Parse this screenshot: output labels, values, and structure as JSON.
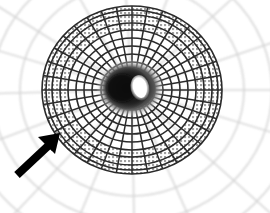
{
  "figure": {
    "title": "Radial mesh funnel with annotation arrow",
    "background_color": "#ffffff",
    "width": 270,
    "height": 213
  },
  "mesh": {
    "name": "polar-funnel-mesh",
    "center_x": 132,
    "center_y": 90,
    "radial_spokes": 36,
    "ring_count": 11,
    "outer_radius_x": 90,
    "outer_radius_y": 84,
    "inner_throat_radius_x": 26,
    "inner_throat_radius_y": 22,
    "line_color": "#262626",
    "faint_line_color": "#c9c9c9",
    "shade_band_color": "#9a9a9a",
    "shade_band_inner_fraction": 0.72,
    "shade_band_outer_fraction": 1.0,
    "ring_radii_fraction": [
      0.17,
      0.26,
      0.35,
      0.44,
      0.53,
      0.62,
      0.71,
      0.8,
      0.88,
      0.95,
      1.0
    ]
  },
  "throat": {
    "name": "central-throat",
    "center_x": 130,
    "center_y": 88,
    "radius_x": 30,
    "radius_y": 26,
    "dark_color": "#1a1a1a",
    "mid_color": "#4d4d4d"
  },
  "highlight": {
    "name": "throat-highlight",
    "center_x": 140,
    "center_y": 88,
    "radius_x": 8,
    "radius_y": 12,
    "color": "#ffffff",
    "rotation_deg": -12
  },
  "outer_web": {
    "name": "outer-faint-web",
    "spoke_count": 16,
    "arc_count": 3,
    "color": "#d6d6d6",
    "extent_radius": 185
  },
  "annotation": {
    "arrow": {
      "name": "annotation-arrow",
      "color": "#000000",
      "tail_x": 16,
      "tail_y": 175,
      "tip_x": 60,
      "tip_y": 134,
      "shaft_width": 7,
      "head_length": 22,
      "head_width": 19,
      "points_at": "shaded outer annulus of the mesh"
    }
  }
}
